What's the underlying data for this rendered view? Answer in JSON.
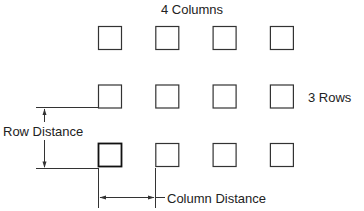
{
  "diagram": {
    "title": "4 Columns",
    "rows_label": "3 Rows",
    "row_distance_label": "Row Distance",
    "column_distance_label": "Column Distance",
    "grid": {
      "columns": 4,
      "rows": 3
    },
    "colors": {
      "stroke": "#333333",
      "highlight_stroke": "#111111",
      "text": "#222222"
    }
  }
}
